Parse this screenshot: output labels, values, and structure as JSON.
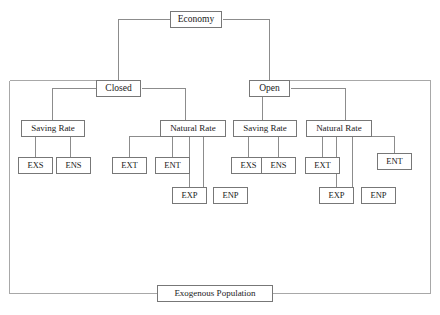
{
  "diagram": {
    "colors": {
      "box_border": "#777777",
      "line": "#8c8c8c",
      "frame": "#a8a8a8",
      "background": "#ffffff",
      "text": "#1a1a1a"
    },
    "nodes": {
      "root": {
        "label": "Economy"
      },
      "level1": [
        {
          "label": "Closed"
        },
        {
          "label": "Open"
        }
      ],
      "level2": [
        {
          "label": "Saving Rate"
        },
        {
          "label": "Natural Rate"
        },
        {
          "label": "Saving Rate"
        },
        {
          "label": "Natural Rate"
        }
      ],
      "leaves": {
        "closed_saving": [
          {
            "label": "EXS"
          },
          {
            "label": "ENS"
          }
        ],
        "closed_natural": [
          {
            "label": "EXT"
          },
          {
            "label": "ENT"
          },
          {
            "label": "EXP"
          },
          {
            "label": "ENP"
          }
        ],
        "open_saving": [
          {
            "label": "EXS"
          },
          {
            "label": "ENS"
          }
        ],
        "open_natural": [
          {
            "label": "EXT"
          },
          {
            "label": "ENT"
          },
          {
            "label": "EXP"
          },
          {
            "label": "ENP"
          }
        ]
      },
      "base": {
        "label": "Exogenous Population"
      }
    }
  }
}
